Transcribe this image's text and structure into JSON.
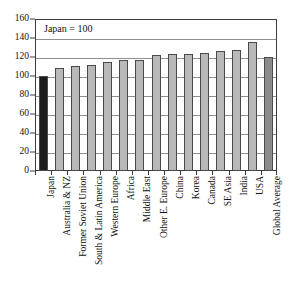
{
  "chart_data": {
    "type": "bar",
    "title": "",
    "subtitle": "",
    "annotation": "Japan = 100",
    "xlabel": "",
    "ylabel": "",
    "ylim": [
      0,
      160
    ],
    "ytick_step": 20,
    "yticks": [
      "160",
      "140",
      "120",
      "100",
      "80",
      "60",
      "40",
      "20",
      "0"
    ],
    "grid": true,
    "legend": "none",
    "categories": [
      "Japan",
      "Australia & NZ",
      "Former Soviet Union",
      "South & Latin America",
      "Western Europe",
      "Africa",
      "Middle East",
      "Other E. Europe",
      "China",
      "Korea",
      "Canada",
      "SE Asia",
      "India",
      "USA",
      "Global Average"
    ],
    "values": [
      100,
      108.5,
      110.5,
      111.5,
      115,
      116.5,
      116.5,
      122.5,
      123.5,
      123.5,
      124.5,
      126.5,
      127.5,
      135.5,
      119.5
    ],
    "bar_styles": [
      "highlight",
      "normal",
      "normal",
      "normal",
      "normal",
      "normal",
      "normal",
      "normal",
      "normal",
      "normal",
      "normal",
      "normal",
      "normal",
      "normal",
      "average"
    ]
  },
  "colors": {
    "bar_normal": "#b9b9b9",
    "bar_highlight": "#1c1c1c",
    "bar_average": "#8b8b8b",
    "bar_border": "#4a4a4a",
    "gridline": "#8e8e8e",
    "frame": "#3c3c3c",
    "text": "#111111",
    "background": "#ffffff"
  }
}
